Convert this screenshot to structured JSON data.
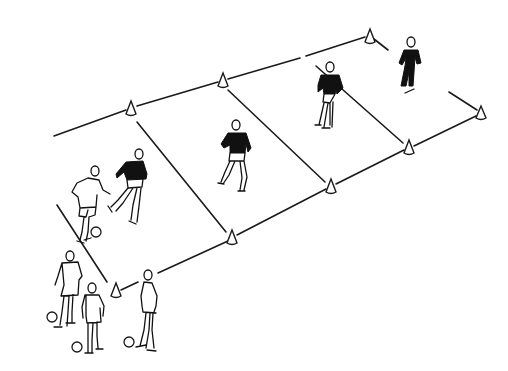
{
  "illustration": {
    "description": "Pen-and-ink drawing of a soccer training drill: a long rectangular pitch marked by cones, divided into four zones, with players and balls",
    "colors": {
      "ink": "#1a1a1a",
      "background": "#ffffff"
    },
    "zones": 4,
    "cones": [
      {
        "x": 131,
        "y": 108
      },
      {
        "x": 223,
        "y": 80
      },
      {
        "x": 370,
        "y": 35
      },
      {
        "x": 481,
        "y": 112
      },
      {
        "x": 409,
        "y": 147
      },
      {
        "x": 331,
        "y": 186
      },
      {
        "x": 232,
        "y": 237
      },
      {
        "x": 116,
        "y": 290
      }
    ],
    "players": [
      {
        "id": "attacker-with-ball",
        "shirt": "white",
        "x": 90,
        "y": 200
      },
      {
        "id": "defender-zone-1",
        "shirt": "black",
        "x": 130,
        "y": 185
      },
      {
        "id": "defender-zone-2",
        "shirt": "black",
        "x": 237,
        "y": 155
      },
      {
        "id": "defender-zone-3",
        "shirt": "black",
        "x": 328,
        "y": 95
      },
      {
        "id": "defender-zone-4",
        "shirt": "black",
        "x": 410,
        "y": 62
      },
      {
        "id": "waiting-player-1",
        "shirt": "white",
        "x": 68,
        "y": 290
      },
      {
        "id": "waiting-player-2",
        "shirt": "white",
        "x": 95,
        "y": 318
      },
      {
        "id": "waiting-player-3",
        "shirt": "white",
        "x": 148,
        "y": 310
      }
    ],
    "balls": [
      {
        "x": 96,
        "y": 232
      },
      {
        "x": 52,
        "y": 317
      },
      {
        "x": 77,
        "y": 347
      },
      {
        "x": 129,
        "y": 342
      }
    ]
  }
}
